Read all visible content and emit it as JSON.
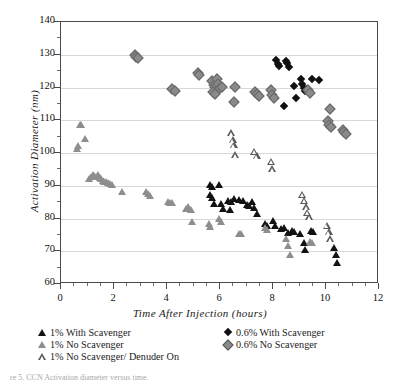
{
  "chart_data": {
    "type": "scatter",
    "title": "",
    "xlabel": "Time After Injection (hours)",
    "ylabel": "Activation Diameter (nm)",
    "xlim": [
      0,
      12
    ],
    "ylim": [
      60,
      140
    ],
    "xticks": [
      0,
      2,
      4,
      6,
      8,
      10,
      12
    ],
    "yticks": [
      60,
      70,
      80,
      90,
      100,
      110,
      120,
      130,
      140
    ],
    "x_minor_step": 0.5,
    "grid": "horizontal",
    "legend_position": "below-plot",
    "series": [
      {
        "name": "1% With Scavenger",
        "marker": "triangle-filled-black",
        "color": "#121212",
        "points": [
          [
            5.62,
            90.2
          ],
          [
            5.7,
            89.6
          ],
          [
            5.98,
            90.1
          ],
          [
            5.62,
            87.1
          ],
          [
            5.68,
            86.4
          ],
          [
            5.78,
            84.4
          ],
          [
            6.02,
            84.3
          ],
          [
            6.1,
            83.0
          ],
          [
            6.3,
            85.4
          ],
          [
            6.42,
            84.9
          ],
          [
            6.38,
            82.6
          ],
          [
            6.52,
            86.1
          ],
          [
            6.72,
            85.5
          ],
          [
            6.88,
            85.3
          ],
          [
            7.02,
            84.0
          ],
          [
            7.08,
            83.8
          ],
          [
            7.22,
            84.9
          ],
          [
            7.3,
            83.2
          ],
          [
            7.38,
            81.4
          ],
          [
            7.7,
            78.4
          ],
          [
            7.78,
            77.6
          ],
          [
            8.0,
            79.1
          ],
          [
            8.08,
            77.8
          ],
          [
            8.3,
            76.8
          ],
          [
            8.42,
            77.0
          ],
          [
            8.58,
            75.6
          ],
          [
            8.7,
            76.3
          ],
          [
            8.8,
            75.8
          ],
          [
            9.0,
            75.2
          ],
          [
            9.18,
            72.6
          ],
          [
            9.22,
            70.4
          ],
          [
            9.42,
            76.2
          ],
          [
            9.5,
            75.8
          ],
          [
            10.3,
            71.0
          ],
          [
            10.38,
            69.0
          ],
          [
            10.42,
            66.4
          ]
        ]
      },
      {
        "name": "1% No Scavenger",
        "marker": "triangle-filled-gray",
        "color": "#8e8e8e",
        "points": [
          [
            0.62,
            101.2
          ],
          [
            0.66,
            102.2
          ],
          [
            0.72,
            108.4
          ],
          [
            0.76,
            108.6
          ],
          [
            0.9,
            104.4
          ],
          [
            1.05,
            92.0
          ],
          [
            1.12,
            92.6
          ],
          [
            1.2,
            93.4
          ],
          [
            1.26,
            93.1
          ],
          [
            1.32,
            92.8
          ],
          [
            1.4,
            93.2
          ],
          [
            1.46,
            92.4
          ],
          [
            1.52,
            92.0
          ],
          [
            1.58,
            91.6
          ],
          [
            1.64,
            91.2
          ],
          [
            1.7,
            91.0
          ],
          [
            1.78,
            90.8
          ],
          [
            1.86,
            90.4
          ],
          [
            1.94,
            90.2
          ],
          [
            2.3,
            88.2
          ],
          [
            3.2,
            88.0
          ],
          [
            3.28,
            87.4
          ],
          [
            3.34,
            87.0
          ],
          [
            4.05,
            85.0
          ],
          [
            4.12,
            84.8
          ],
          [
            4.18,
            84.6
          ],
          [
            4.72,
            83.0
          ],
          [
            4.78,
            83.6
          ],
          [
            4.84,
            82.8
          ],
          [
            4.9,
            82.6
          ],
          [
            4.96,
            78.8
          ],
          [
            5.58,
            78.2
          ],
          [
            5.64,
            77.4
          ],
          [
            5.98,
            80.0
          ],
          [
            6.04,
            79.0
          ],
          [
            6.7,
            75.4
          ],
          [
            6.78,
            75.2
          ],
          [
            7.7,
            77.0
          ],
          [
            7.76,
            76.4
          ],
          [
            8.48,
            73.6
          ],
          [
            8.58,
            71.6
          ],
          [
            8.66,
            68.8
          ],
          [
            9.4,
            72.8
          ],
          [
            9.48,
            72.4
          ]
        ]
      },
      {
        "name": "1% No Scavenger/  Denuder On",
        "marker": "triangle-open",
        "color": "#5a5a5a",
        "points": [
          [
            6.42,
            106.0
          ],
          [
            6.48,
            104.8
          ],
          [
            6.52,
            104.2
          ],
          [
            6.58,
            102.0
          ],
          [
            7.3,
            104.0
          ],
          [
            7.38,
            103.6
          ],
          [
            7.92,
            102.8
          ],
          [
            7.98,
            101.4
          ],
          [
            9.1,
            94.6
          ],
          [
            9.18,
            93.6
          ],
          [
            9.24,
            92.6
          ],
          [
            9.3,
            91.8
          ],
          [
            9.36,
            91.4
          ],
          [
            10.02,
            89.6
          ],
          [
            10.1,
            88.6
          ],
          [
            10.16,
            87.4
          ]
        ]
      },
      {
        "name": "0.6% With Scavenger",
        "marker": "diamond-filled-black",
        "color": "#111111",
        "points": [
          [
            8.12,
            128.4
          ],
          [
            8.18,
            127.2
          ],
          [
            8.22,
            126.6
          ],
          [
            8.48,
            128.2
          ],
          [
            8.54,
            127.4
          ],
          [
            8.6,
            126.4
          ],
          [
            8.4,
            114.2
          ],
          [
            8.78,
            120.4
          ],
          [
            9.04,
            122.6
          ],
          [
            9.1,
            121.0
          ],
          [
            9.16,
            120.0
          ],
          [
            9.22,
            118.8
          ],
          [
            9.3,
            119.4
          ],
          [
            8.86,
            116.8
          ],
          [
            9.48,
            122.6
          ],
          [
            9.72,
            122.2
          ]
        ]
      },
      {
        "name": "0.6% No Scavenger",
        "marker": "diamond-filled-gray",
        "color": "#8a8a8a",
        "points": [
          [
            2.74,
            130.2
          ],
          [
            2.8,
            129.6
          ],
          [
            2.86,
            129.2
          ],
          [
            4.16,
            120.0
          ],
          [
            4.26,
            119.2
          ],
          [
            5.12,
            124.8
          ],
          [
            5.18,
            124.2
          ],
          [
            5.66,
            122.4
          ],
          [
            5.72,
            121.2
          ],
          [
            5.78,
            120.6
          ],
          [
            5.84,
            122.8
          ],
          [
            5.9,
            121.4
          ],
          [
            5.96,
            120.2
          ],
          [
            6.02,
            120.6
          ],
          [
            5.7,
            118.8
          ],
          [
            5.78,
            118.2
          ],
          [
            6.52,
            120.4
          ],
          [
            6.48,
            115.8
          ],
          [
            7.28,
            119.0
          ],
          [
            7.36,
            118.4
          ],
          [
            7.42,
            117.8
          ],
          [
            7.88,
            119.4
          ],
          [
            7.94,
            118.0
          ],
          [
            8.0,
            117.2
          ],
          [
            9.3,
            119.6
          ],
          [
            9.36,
            118.6
          ],
          [
            10.12,
            113.6
          ],
          [
            10.02,
            110.0
          ],
          [
            10.08,
            108.8
          ],
          [
            10.14,
            108.2
          ],
          [
            10.6,
            107.4
          ],
          [
            10.66,
            106.8
          ],
          [
            10.7,
            106.2
          ]
        ]
      }
    ]
  },
  "legend": {
    "left_items": [
      {
        "label": "1% With Scavenger",
        "marker": "triangle-filled-black"
      },
      {
        "label": "1% No Scavenger",
        "marker": "triangle-filled-gray"
      },
      {
        "label": "1% No Scavenger/  Denuder On",
        "marker": "triangle-open"
      }
    ],
    "right_items": [
      {
        "label": "0.6% With Scavenger",
        "marker": "diamond-filled-black"
      },
      {
        "label": "0.6% No Scavenger",
        "marker": "diamond-filled-gray"
      }
    ]
  },
  "caption": "re 5. CCN Activation diameter versus time."
}
